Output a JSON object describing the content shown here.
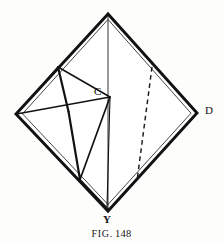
{
  "figure": {
    "caption_prefix": "FIG.",
    "caption_number": "148",
    "caption_full": "FIG. 148",
    "ink_color": "#121212",
    "background_color": "#fdfdfc",
    "labels": [
      {
        "id": "C",
        "text": "C",
        "x": 98,
        "y": 92,
        "role": "interior-vertex-label"
      },
      {
        "id": "D",
        "text": "D",
        "x": 208,
        "y": 111,
        "role": "right-vertex-label"
      },
      {
        "id": "Y",
        "text": "Y",
        "x": 108,
        "y": 220,
        "role": "bottom-vertex-label"
      }
    ],
    "vertices": {
      "top": {
        "x": 108,
        "y": 14
      },
      "left": {
        "x": 16,
        "y": 114
      },
      "right_D": {
        "x": 197,
        "y": 113
      },
      "bottom_Y": {
        "x": 108,
        "y": 211
      },
      "fold_A": {
        "x": 58,
        "y": 67
      },
      "point_C": {
        "x": 110,
        "y": 97
      },
      "cross": {
        "x": 68,
        "y": 111
      },
      "base_J": {
        "x": 80,
        "y": 179
      },
      "dash_top": {
        "x": 152,
        "y": 67
      },
      "dash_bottom": {
        "x": 137,
        "y": 181
      }
    },
    "line_styles": {
      "outline": "double-heavy",
      "interior": "solid-thin",
      "hidden": "dashed"
    }
  }
}
